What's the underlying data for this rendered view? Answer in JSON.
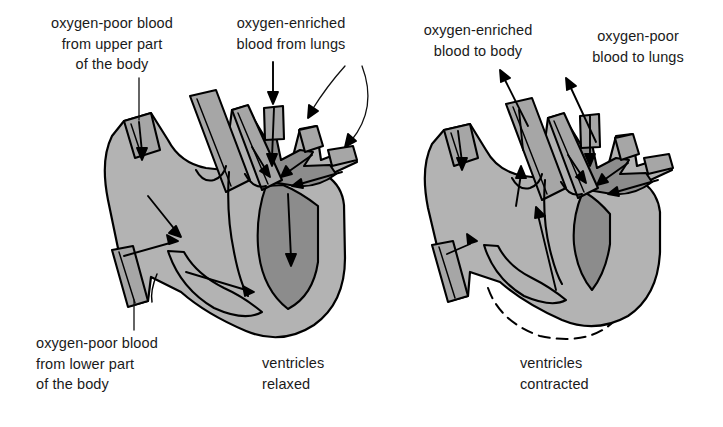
{
  "figure": {
    "type": "anatomical-diagram",
    "panel_count": 2
  },
  "colors": {
    "background": "#ffffff",
    "muscle_light_gray": "#b3b3b3",
    "chamber_dark_gray": "#8c8c8c",
    "vessel_mid_gray": "#a6a6a6",
    "outline_black": "#000000",
    "text_black": "#1a1a1a"
  },
  "left_panel": {
    "caption": "ventricles\nrelaxed",
    "caption_line1": "ventricles",
    "caption_line2": "relaxed",
    "labels": [
      {
        "id": "vena-cava-superior",
        "text": "oxygen-poor blood\nfrom upper part\nof the body",
        "pointer": "straight-line-down-to-superior-vena-cava"
      },
      {
        "id": "pulmonary-veins",
        "text": "oxygen-enriched\nblood from lungs",
        "pointer": "straight-arrow-plus-two-curved-arrows-to-pulmonary-veins"
      },
      {
        "id": "vena-cava-inferior",
        "text": "oxygen-poor blood\nfrom lower part\nof the body",
        "pointer": "line-up-to-inferior-vena-cava"
      }
    ]
  },
  "right_panel": {
    "caption": "ventricles\ncontracted",
    "caption_line1": "ventricles",
    "caption_line2": "contracted",
    "labels": [
      {
        "id": "aorta",
        "text": "oxygen-enriched\nblood to body",
        "pointer": "arrow-up-out-of-aorta"
      },
      {
        "id": "pulmonary-artery",
        "text": "oxygen-poor\nblood to lungs",
        "pointer": "arrow-up-out-of-pulmonary-artery"
      }
    ],
    "annotation": {
      "dashed_outline": "previous relaxed ventricle outline shown dashed"
    }
  }
}
